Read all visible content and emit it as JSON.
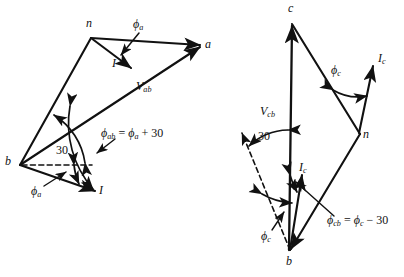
{
  "figure": {
    "stroke_color": "#111111",
    "background": "#ffffff"
  },
  "diagrams": [
    {
      "id": "left",
      "name": "a-phase phasor diagram",
      "nodes": [
        {
          "name": "node-n",
          "label": "n",
          "x": 91,
          "y": 38
        },
        {
          "name": "node-a",
          "label": "a",
          "x": 203,
          "y": 47
        },
        {
          "name": "node-b",
          "label": "b",
          "x": 20,
          "y": 165
        }
      ],
      "labels": [
        {
          "name": "label-n",
          "text": "n",
          "x": 86,
          "y": 24
        },
        {
          "name": "label-a",
          "text": "a",
          "x": 206,
          "y": 40
        },
        {
          "name": "label-b",
          "text": "b",
          "x": 6,
          "y": 158
        },
        {
          "name": "label-phi-a-top",
          "base": "ϕ",
          "sub": "a",
          "x": 136,
          "y": 25
        },
        {
          "name": "label-current-I-top",
          "base": "I",
          "sub": "",
          "x": 112,
          "y": 63
        },
        {
          "name": "label-voltage-Vab",
          "base": "V",
          "sub": "ab",
          "x": 136,
          "y": 85
        },
        {
          "name": "label-angle-30",
          "text": "30",
          "x": 58,
          "y": 152
        },
        {
          "name": "label-phi-ab-equation",
          "text": "ϕab = ϕa + 30",
          "x": 101,
          "y": 134
        },
        {
          "name": "label-phi-a-bottom",
          "base": "ϕ",
          "sub": "a",
          "x": 34,
          "y": 192
        },
        {
          "name": "label-current-I-bottom",
          "base": "I",
          "sub": "",
          "x": 99,
          "y": 190
        }
      ]
    },
    {
      "id": "right",
      "name": "c-phase phasor diagram",
      "nodes": [
        {
          "name": "node-c",
          "label": "c",
          "x": 292,
          "y": 22
        },
        {
          "name": "node-n",
          "label": "n",
          "x": 359,
          "y": 133
        },
        {
          "name": "node-b",
          "label": "b",
          "x": 290,
          "y": 252
        }
      ],
      "labels": [
        {
          "name": "label-c",
          "text": "c",
          "x": 288,
          "y": 5
        },
        {
          "name": "label-n",
          "text": "n",
          "x": 363,
          "y": 130
        },
        {
          "name": "label-b",
          "text": "b",
          "x": 287,
          "y": 258
        },
        {
          "name": "label-voltage-Vcb",
          "base": "V",
          "sub": "cb",
          "x": 262,
          "y": 110
        },
        {
          "name": "label-phi-c-top",
          "base": "ϕ",
          "sub": "c",
          "x": 334,
          "y": 71
        },
        {
          "name": "label-current-Ic-top",
          "base": "I",
          "sub": "c",
          "x": 379,
          "y": 58
        },
        {
          "name": "label-angle-30",
          "text": "30",
          "x": 260,
          "y": 137
        },
        {
          "name": "label-current-Ic-mid",
          "base": "I",
          "sub": "c",
          "x": 300,
          "y": 167
        },
        {
          "name": "label-phi-c-bottom",
          "base": "ϕ",
          "sub": "c",
          "x": 264,
          "y": 236
        },
        {
          "name": "label-phi-cb-equation",
          "text": "ϕcb = ϕc − 30",
          "x": 328,
          "y": 221
        }
      ]
    }
  ],
  "equations": {
    "left": {
      "lhs_base": "ϕ",
      "lhs_sub": "ab",
      "eq": " = ",
      "rhs_base": "ϕ",
      "rhs_sub": "a",
      "tail": " + 30"
    },
    "right": {
      "lhs_base": "ϕ",
      "lhs_sub": "cb",
      "eq": " = ",
      "rhs_base": "ϕ",
      "rhs_sub": "c",
      "tail": " − 30"
    }
  },
  "angles": {
    "left_30": "30",
    "right_30": "30"
  }
}
